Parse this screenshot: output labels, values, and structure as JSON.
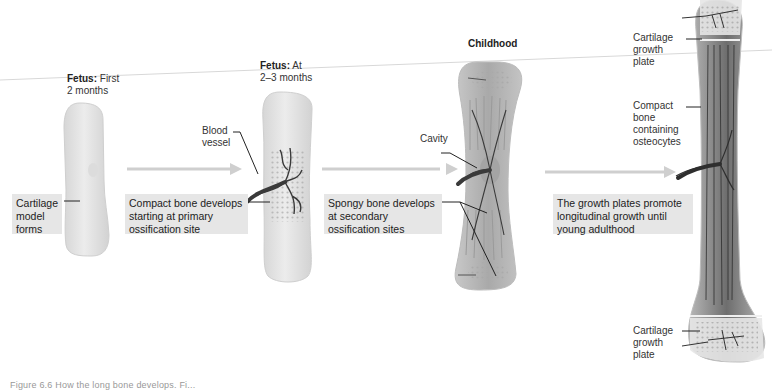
{
  "stages": [
    {
      "title_bold": "Fetus:",
      "title_rest": " First",
      "title_line2": "2 months",
      "box": [
        "Cartilage",
        "model",
        "forms"
      ]
    },
    {
      "title_bold": "Fetus:",
      "title_rest": " At",
      "title_line2": "2–3 months",
      "label_blood_vessel": [
        "Blood",
        "vessel"
      ],
      "box": [
        "Compact bone develops",
        "starting at primary",
        "ossification site"
      ]
    },
    {
      "title_bold": "Childhood",
      "label_cavity": "Cavity",
      "box": [
        "Spongy bone develops",
        "at secondary",
        "ossification sites"
      ]
    },
    {
      "labels": {
        "cartilage_top": [
          "Cartilage",
          "growth",
          "plate"
        ],
        "compact": [
          "Compact",
          "bone",
          "containing",
          "osteocytes"
        ],
        "cartilage_bottom": [
          "Cartilage",
          "growth",
          "plate"
        ]
      },
      "box": [
        "The growth plates promote",
        "longitudinal growth until",
        "young adulthood"
      ]
    }
  ],
  "caption": "Figure 6.6 How the long bone develops. Fi...",
  "colors": {
    "box_bg": "#e6e6e6",
    "arrow": "#c9c9c9",
    "cartilage": "#e4e4e4",
    "bone_dark": "#7a7a7a",
    "vessel": "#3a3a3a"
  }
}
